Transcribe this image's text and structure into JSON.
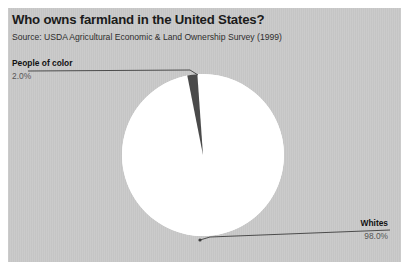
{
  "chart_data": {
    "type": "pie",
    "title": "Who owns farmland in the United States?",
    "subtitle": "Source: USDA Agricultural Economic & Land Ownership Survey (1999)",
    "xlabel": "",
    "ylabel": "",
    "grid": false,
    "legend_position": "callout-labels",
    "categories": [
      "Whites",
      "People of color"
    ],
    "values": [
      98.0,
      2.0
    ],
    "value_labels": [
      "98.0%",
      "2.0%"
    ],
    "units": "percent",
    "total": 100.0,
    "slices": [
      {
        "label": "Whites",
        "value": 98.0,
        "value_label": "98.0%",
        "color": "#ffffff",
        "callout_position": "bottom-right"
      },
      {
        "label": "People of color",
        "value": 2.0,
        "value_label": "2.0%",
        "color": "#4a4a4a",
        "callout_position": "top-left"
      }
    ],
    "start_angle_deg": -94,
    "direction": "clockwise"
  },
  "figure": {
    "title": "Who owns farmland in the United States?",
    "source": "Source: USDA Agricultural Economic & Land Ownership Survey (1999)",
    "panel_color": "#c9c9c9",
    "accent_color": "#4a4a4a",
    "slice_color": "#ffffff",
    "text_color": "#1b1b1b",
    "muted_text_color": "#555555",
    "leader_line_color": "#3d3d3d"
  },
  "callouts": {
    "people_of_color": {
      "name": "People of color",
      "value": "2.0%"
    },
    "whites": {
      "name": "Whites",
      "value": "98.0%"
    }
  }
}
